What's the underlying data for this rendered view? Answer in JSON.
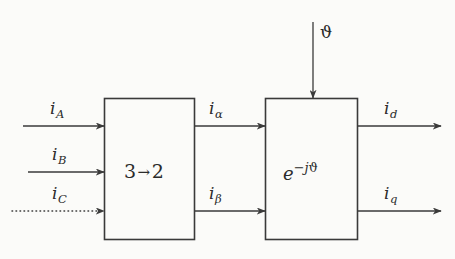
{
  "diagram": {
    "background_color": "#fbfbf9",
    "line_color": "#3a3a3a",
    "blocks": [
      {
        "id": "block-3to2",
        "label_left": "3",
        "label_arrow": "→",
        "label_right": "2"
      },
      {
        "id": "block-rotation",
        "label_base": "e",
        "label_exponent_sign": "−",
        "label_exponent_j": "j",
        "label_exponent_theta": "ϑ"
      }
    ],
    "inputs": [
      {
        "id": "input-ia",
        "symbol": "i",
        "subscript": "A",
        "line_style": "solid"
      },
      {
        "id": "input-ib",
        "symbol": "i",
        "subscript": "B",
        "line_style": "solid"
      },
      {
        "id": "input-ic",
        "symbol": "i",
        "subscript": "C",
        "line_style": "dotted"
      }
    ],
    "intermediate": [
      {
        "id": "signal-ialpha",
        "symbol": "i",
        "subscript": "α",
        "line_style": "solid"
      },
      {
        "id": "signal-ibeta",
        "symbol": "i",
        "subscript": "β",
        "line_style": "solid"
      }
    ],
    "control": {
      "id": "control-theta",
      "symbol": "ϑ",
      "line_style": "solid",
      "direction": "down"
    },
    "outputs": [
      {
        "id": "output-id",
        "symbol": "i",
        "subscript": "d",
        "line_style": "solid"
      },
      {
        "id": "output-iq",
        "symbol": "i",
        "subscript": "q",
        "line_style": "solid"
      }
    ]
  }
}
